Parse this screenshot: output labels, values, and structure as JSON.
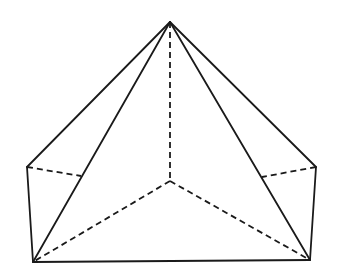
{
  "diagram": {
    "type": "geometric-solid",
    "colors": {
      "stroke": "#1a1a1a",
      "background": "#ffffff"
    },
    "vertices": {
      "apex": [
        170,
        22
      ],
      "left_upper": [
        27,
        167
      ],
      "right_upper": [
        316,
        167
      ],
      "center_hidden": [
        170,
        181
      ],
      "bottom_left": [
        33,
        262
      ],
      "bottom_right": [
        310,
        260
      ],
      "left_hidden_mid": [
        81,
        176
      ],
      "right_hidden_mid": [
        262,
        177
      ]
    },
    "solid_edges": [
      [
        "apex",
        "left_upper"
      ],
      [
        "apex",
        "right_upper"
      ],
      [
        "apex",
        "bottom_left"
      ],
      [
        "apex",
        "bottom_right"
      ],
      [
        "left_upper",
        "bottom_left"
      ],
      [
        "right_upper",
        "bottom_right"
      ],
      [
        "bottom_left",
        "bottom_right"
      ]
    ],
    "dashed_edges": [
      [
        "apex",
        "center_hidden"
      ],
      [
        "center_hidden",
        "bottom_left"
      ],
      [
        "center_hidden",
        "bottom_right"
      ],
      [
        "left_upper",
        "left_hidden_mid"
      ],
      [
        "right_upper",
        "right_hidden_mid"
      ]
    ]
  }
}
